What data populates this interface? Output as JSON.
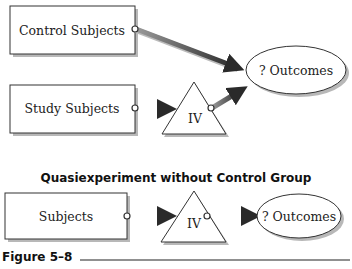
{
  "diagram1": {
    "control_subjects": "Control Subjects",
    "study_subjects": "Study Subjects",
    "iv": "IV",
    "outcomes": "? Outcomes"
  },
  "diagram2": {
    "title": "Quasiexperiment without Control Group",
    "subjects": "Subjects",
    "iv": "IV",
    "outcomes": "? Outcomes"
  },
  "caption": {
    "figure_label": "Figure 5–8"
  },
  "colors": {
    "arrow": "#3a3a3a",
    "box_border": "#333333",
    "shadow": "#b0b0b0"
  }
}
